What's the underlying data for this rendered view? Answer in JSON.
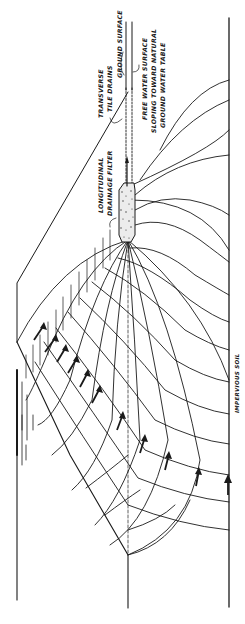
{
  "figure": {
    "orientation": "rotated 90 degrees clockwise",
    "ink_color": "#1a1a1a",
    "background_color": "#ffffff"
  },
  "labels": {
    "ground_surface": "GROUND SURFACE",
    "transverse_line1": "TRANSVERSE",
    "transverse_line2": "TILE DRAINS",
    "free_water_line1": "FREE   WATER   SURFACE",
    "free_water_line2": "SLOPING TOWARD NATURAL",
    "free_water_line3": "GROUND  WATER  TABLE",
    "filter_line1": "LONGITUDINAL",
    "filter_line2": "DRAINAGE FILTER",
    "impervious": "IMPERVIOUS SOIL"
  },
  "elements": {
    "flow_arrows": 12,
    "equipotential_lines": "curved",
    "flow_lines": "curved"
  }
}
